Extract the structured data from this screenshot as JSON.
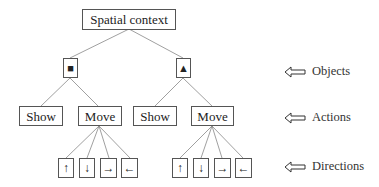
{
  "diagram": {
    "root": {
      "label": "Spatial context"
    },
    "objects": [
      {
        "symbol": "■",
        "name": "square",
        "actions": [
          {
            "label": "Show"
          },
          {
            "label": "Move",
            "directions": [
              "↑",
              "↓",
              "→",
              "←"
            ]
          }
        ]
      },
      {
        "symbol": "▲",
        "name": "triangle",
        "actions": [
          {
            "label": "Show"
          },
          {
            "label": "Move",
            "directions": [
              "↑",
              "↓",
              "→",
              "←"
            ]
          }
        ]
      }
    ],
    "legend": [
      {
        "label": "Objects"
      },
      {
        "label": "Actions"
      },
      {
        "label": "Directions"
      }
    ]
  },
  "colors": {
    "line": "#777777",
    "border": "#555555",
    "text": "#222222"
  }
}
